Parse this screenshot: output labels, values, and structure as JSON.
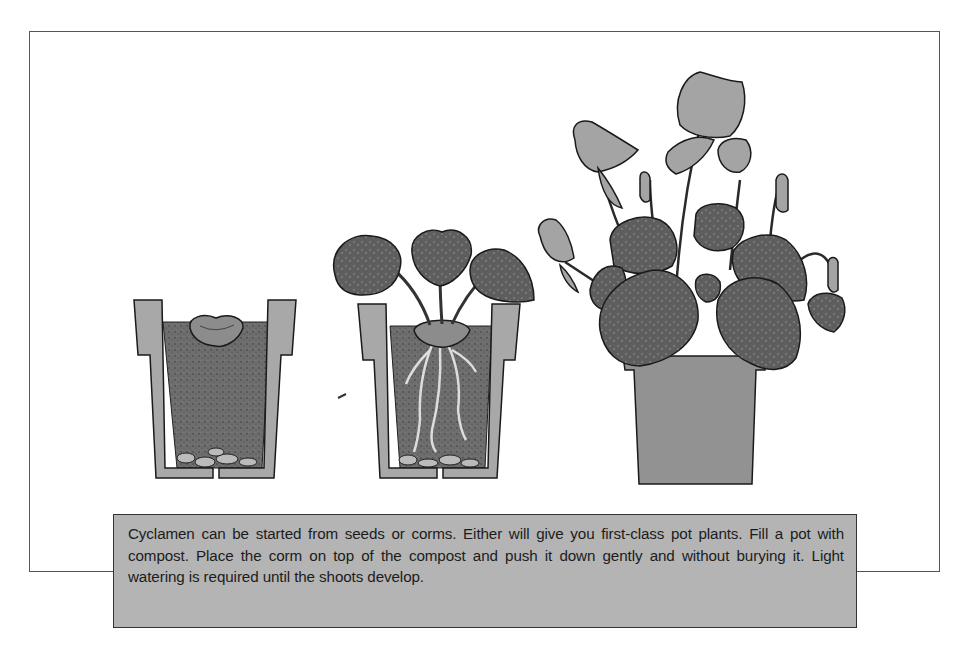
{
  "figure": {
    "stages": [
      {
        "label": "corm-on-compost",
        "description": "Pot filled with compost, corm placed on top"
      },
      {
        "label": "young-plant",
        "description": "Corm with roots and three young leaves"
      },
      {
        "label": "flowering-plant",
        "description": "Mature cyclamen with flowers and variegated leaves"
      }
    ],
    "colors": {
      "pot": "#a8a8a8",
      "compost": "#6e6e6e",
      "leaf": "#5a5a5a",
      "flower": "#9a9a9a",
      "caption_bg": "#b4b4b4",
      "frame": "#555555"
    }
  },
  "caption": {
    "text": "Cyclamen can be started from seeds or corms. Either will give you first-class pot plants. Fill a pot with compost. Place the corm on top of the compost and push it down gently and without burying it. Light watering is required until the shoots develop."
  }
}
